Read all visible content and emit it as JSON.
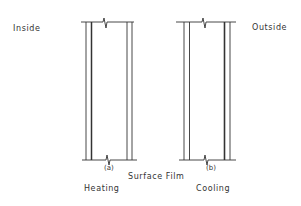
{
  "labels": {
    "inside": "Inside",
    "outside": "Outside",
    "surface_film": "Surface Film",
    "heating": "Heating",
    "cooling": "Cooling"
  },
  "panels": [
    {
      "id": "a",
      "tag": "(a)",
      "mode": "Heating"
    },
    {
      "id": "b",
      "tag": "(b)",
      "mode": "Cooling"
    }
  ],
  "colors": {
    "line": "#333333",
    "background": "#ffffff"
  }
}
